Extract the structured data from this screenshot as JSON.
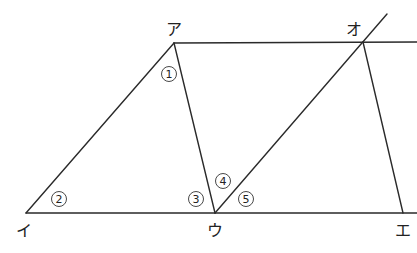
{
  "diagram": {
    "type": "geometry",
    "stroke_color": "#2a2a2a",
    "vertices": [
      {
        "id": "a",
        "label": "ア",
        "x": 174,
        "y": 43,
        "lx": 166,
        "ly": 35
      },
      {
        "id": "i",
        "label": "イ",
        "x": 26,
        "y": 213,
        "lx": 16,
        "ly": 236
      },
      {
        "id": "u",
        "label": "ウ",
        "x": 215,
        "y": 213,
        "lx": 207,
        "ly": 236
      },
      {
        "id": "o",
        "label": "オ",
        "x": 363,
        "y": 42,
        "lx": 346,
        "ly": 35
      },
      {
        "id": "e",
        "label": "エ",
        "x": 403,
        "y": 213,
        "lx": 395,
        "ly": 236
      }
    ],
    "segments": [
      {
        "name": "line-a-top",
        "x1": 174,
        "y1": 43,
        "x2": 417,
        "y2": 42
      },
      {
        "name": "line-i-bottom",
        "x1": 26,
        "y1": 213,
        "x2": 417,
        "y2": 213
      },
      {
        "name": "segment-a-i",
        "x1": 174,
        "y1": 43,
        "x2": 26,
        "y2": 213
      },
      {
        "name": "segment-a-u",
        "x1": 174,
        "y1": 43,
        "x2": 215,
        "y2": 213
      },
      {
        "name": "line-u-o-extended",
        "x1": 215,
        "y1": 213,
        "x2": 387,
        "y2": 14
      },
      {
        "name": "segment-o-e",
        "x1": 363,
        "y1": 42,
        "x2": 403,
        "y2": 213
      }
    ],
    "angles": [
      {
        "id": "angle-1",
        "label": "1",
        "x": 169,
        "y": 74
      },
      {
        "id": "angle-2",
        "label": "2",
        "x": 59,
        "y": 199
      },
      {
        "id": "angle-3",
        "label": "3",
        "x": 196,
        "y": 199
      },
      {
        "id": "angle-4",
        "label": "4",
        "x": 223,
        "y": 181
      },
      {
        "id": "angle-5",
        "label": "5",
        "x": 246,
        "y": 199
      }
    ]
  }
}
